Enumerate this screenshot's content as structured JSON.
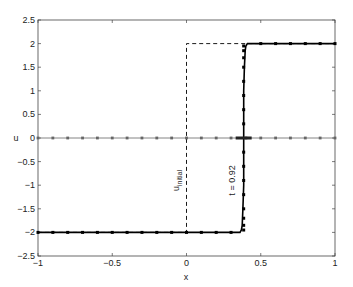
{
  "chart_data": {
    "type": "line",
    "title": "",
    "xlabel": "x",
    "ylabel": "u",
    "xlim": [
      -1,
      1
    ],
    "ylim": [
      -2.5,
      2.5
    ],
    "xticks": [
      -1,
      -0.5,
      0,
      0.5,
      1
    ],
    "xtick_labels": [
      "-1",
      "-0.5",
      "0",
      "0.5",
      "1"
    ],
    "yticks": [
      -2.5,
      -2,
      -1.5,
      -1,
      -0.5,
      0,
      0.5,
      1,
      1.5,
      2,
      2.5
    ],
    "ytick_labels": [
      "-2.5",
      "-2",
      "-1.5",
      "-1",
      "-0.5",
      "0",
      "0.5",
      "1",
      "1.5",
      "2",
      "2.5"
    ],
    "grid": false,
    "series": [
      {
        "name": "u_initial",
        "style": "dashed",
        "color": "#000000",
        "x": [
          -1,
          0,
          0,
          1
        ],
        "y": [
          -2,
          -2,
          2,
          2
        ]
      },
      {
        "name": "t = 0.92",
        "style": "solid-thick-markers",
        "color": "#000000",
        "front_x": 0.385,
        "x": [
          -1,
          -0.9,
          -0.8,
          -0.7,
          -0.6,
          -0.5,
          -0.4,
          -0.3,
          -0.2,
          -0.1,
          0,
          0.1,
          0.2,
          0.3,
          0.36,
          0.37,
          0.375,
          0.38,
          0.385,
          0.385,
          0.385,
          0.39,
          0.395,
          0.4,
          0.41,
          0.5,
          0.6,
          0.7,
          0.8,
          0.9,
          1
        ],
        "y": [
          -2,
          -2,
          -2,
          -2,
          -2,
          -2,
          -2,
          -2,
          -2,
          -2,
          -2,
          -2,
          -2,
          -2,
          -2,
          -1.95,
          -1.85,
          -1.5,
          -1,
          0,
          1,
          1.5,
          1.85,
          1.95,
          2,
          2,
          2,
          2,
          2,
          2,
          2
        ]
      },
      {
        "name": "zero line",
        "style": "solid-markers",
        "color": "#666666",
        "x": [
          -1,
          -0.9,
          -0.8,
          -0.7,
          -0.6,
          -0.5,
          -0.4,
          -0.3,
          -0.2,
          -0.1,
          0,
          0.1,
          0.2,
          0.3,
          0.4,
          0.5,
          0.6,
          0.7,
          0.8,
          0.9,
          1
        ],
        "y": [
          0,
          0,
          0,
          0,
          0,
          0,
          0,
          0,
          0,
          0,
          0,
          0,
          0,
          0,
          0,
          0,
          0,
          0,
          0,
          0,
          0
        ]
      }
    ],
    "annotations": [
      {
        "text": "u",
        "sub": "initial",
        "x": -0.05,
        "y": -0.9,
        "rotation": -90
      },
      {
        "text": "t = 0.92",
        "x": 0.33,
        "y": -0.9,
        "rotation": -90
      }
    ]
  }
}
